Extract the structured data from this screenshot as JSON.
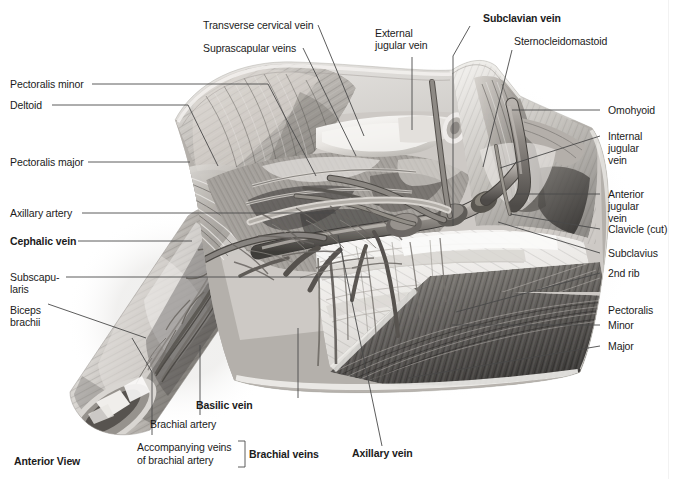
{
  "figure": {
    "view_caption": "Anterior View",
    "domain": "anatomical-illustration",
    "background_color": "#ffffff",
    "ink_color": "#1b1b1b",
    "leader_color": "#555555"
  },
  "labels": {
    "transverse_cervical_vein": "Transverse cervical vein",
    "suprascapular_veins": "Suprascapular veins",
    "external_jugular_vein_l1": "External",
    "external_jugular_vein_l2": "jugular vein",
    "subclavian_vein": "Subclavian vein",
    "sternocleidomastoid": "Sternocleidomastoid",
    "pectoralis_minor": "Pectoralis minor",
    "deltoid": "Deltoid",
    "pectoralis_major": "Pectoralis major",
    "axillary_artery": "Axillary artery",
    "cephalic_vein": "Cephalic vein",
    "subscapularis_l1": "Subscapu-",
    "subscapularis_l2": "laris",
    "biceps_brachii_l1": "Biceps",
    "biceps_brachii_l2": "brachii",
    "omohyoid": "Omohyoid",
    "internal_jugular_vein_l1": "Internal",
    "internal_jugular_vein_l2": "jugular",
    "internal_jugular_vein_l3": "vein",
    "anterior_jugular_vein_l1": "Anterior",
    "anterior_jugular_vein_l2": "jugular",
    "anterior_jugular_vein_l3": "vein",
    "clavicle_cut": "Clavicle (cut)",
    "subclavius": "Subclavius",
    "second_rib": "2nd rib",
    "pectoralis_group": "Pectoralis",
    "pectoralis_minor_r": "Minor",
    "pectoralis_major_r": "Major",
    "basilic_vein": "Basilic vein",
    "brachial_artery": "Brachial artery",
    "accompanying_veins_l1": "Accompanying veins",
    "accompanying_veins_l2": "of brachial artery",
    "brachial_veins": "Brachial veins",
    "axillary_vein": "Axillary vein",
    "anterior_view": "Anterior View"
  }
}
